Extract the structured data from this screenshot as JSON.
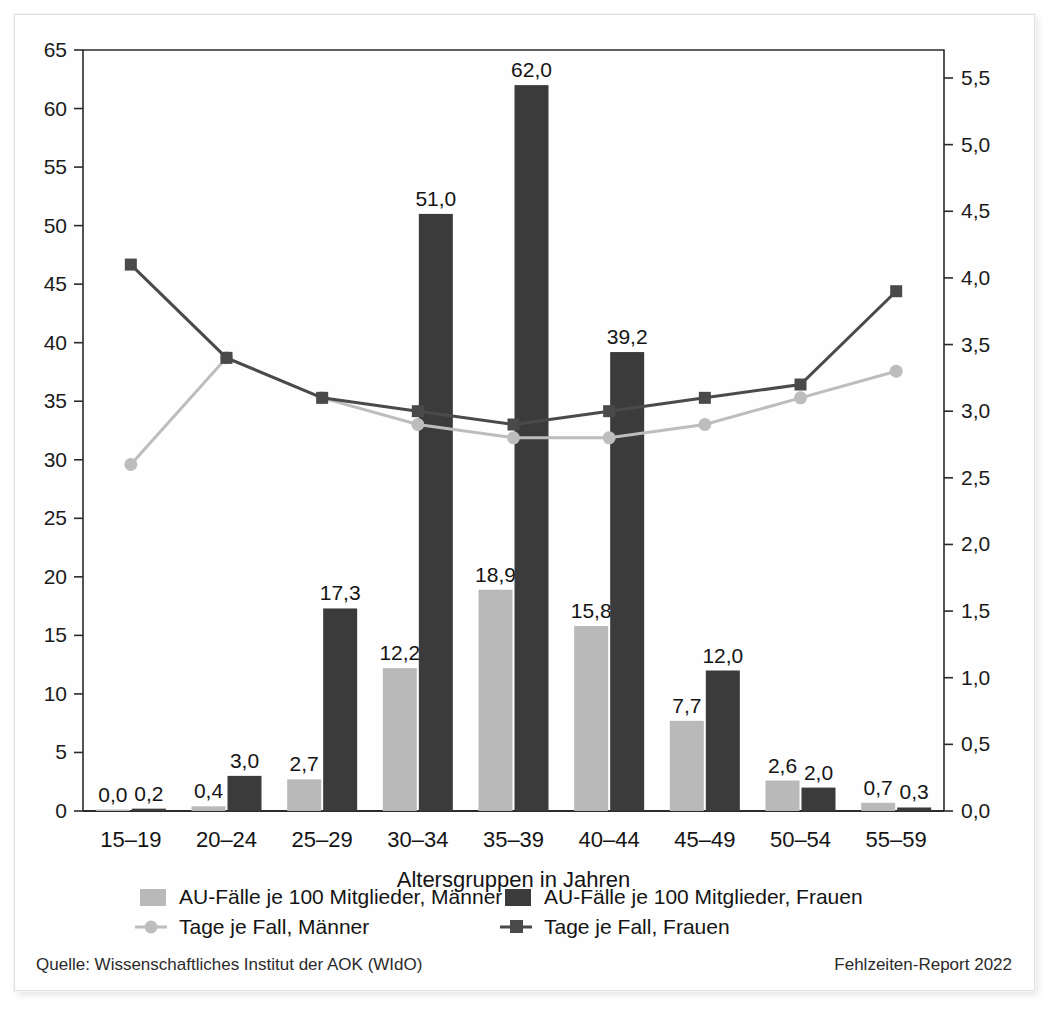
{
  "axis": {
    "left_ticks": [
      "0",
      "5",
      "10",
      "15",
      "20",
      "25",
      "30",
      "35",
      "40",
      "45",
      "50",
      "55",
      "60",
      "65"
    ],
    "right_ticks": [
      "0,0",
      "0,5",
      "1,0",
      "1,5",
      "2,0",
      "2,5",
      "3,0",
      "3,5",
      "4,0",
      "4,5",
      "5,0",
      "5,5"
    ],
    "x_title": "Altersgruppen in Jahren"
  },
  "legend": {
    "items": [
      {
        "label": "AU-Fälle je 100 Mitglieder, Männer",
        "marker": "square-swatch",
        "color": "#b9b9b9"
      },
      {
        "label": "AU-Fälle je 100 Mitglieder, Frauen",
        "marker": "square-swatch",
        "color": "#3b3b3b"
      },
      {
        "label": "Tage je Fall, Männer",
        "marker": "line-circle-marker",
        "color": "#bdbdbd"
      },
      {
        "label": "Tage je Fall, Frauen",
        "marker": "line-square-marker",
        "color": "#4a4a4a"
      }
    ]
  },
  "footer": {
    "source": "Quelle: Wissenschaftliches Institut der AOK (WIdO)",
    "report": "Fehlzeiten-Report 2022"
  },
  "chart_data": {
    "type": "bar",
    "title": "",
    "xlabel": "Altersgruppen in Jahren",
    "ylabel": "",
    "categories": [
      "15–19",
      "20–24",
      "25–29",
      "30–34",
      "35–39",
      "40–44",
      "45–49",
      "50–54",
      "55–59"
    ],
    "ylim": [
      0,
      65
    ],
    "y2lim": [
      0.0,
      5.71
    ],
    "grid": false,
    "legend_position": "bottom",
    "series": [
      {
        "name": "AU-Fälle je 100 Mitglieder, Männer",
        "type": "bar",
        "axis": "left",
        "color": "#b9b9b9",
        "values": [
          0.0,
          0.4,
          2.7,
          12.2,
          18.9,
          15.8,
          7.7,
          2.6,
          0.7
        ],
        "labels": [
          "0,0",
          "0,4",
          "2,7",
          "12,2",
          "18,9",
          "15,8",
          "7,7",
          "2,6",
          "0,7"
        ]
      },
      {
        "name": "AU-Fälle je 100 Mitglieder, Frauen",
        "type": "bar",
        "axis": "left",
        "color": "#3b3b3b",
        "values": [
          0.2,
          3.0,
          17.3,
          51.0,
          62.0,
          39.2,
          12.0,
          2.0,
          0.3
        ],
        "labels": [
          "0,2",
          "3,0",
          "17,3",
          "51,0",
          "62,0",
          "39,2",
          "12,0",
          "2,0",
          "0,3"
        ]
      },
      {
        "name": "Tage je Fall, Männer",
        "type": "line",
        "axis": "right",
        "color": "#bdbdbd",
        "marker": "circle",
        "values": [
          2.6,
          3.4,
          3.1,
          2.9,
          2.8,
          2.8,
          2.9,
          3.1,
          3.3
        ]
      },
      {
        "name": "Tage je Fall, Frauen",
        "type": "line",
        "axis": "right",
        "color": "#4a4a4a",
        "marker": "square",
        "values": [
          4.1,
          3.4,
          3.1,
          3.0,
          2.9,
          3.0,
          3.1,
          3.2,
          3.9
        ]
      }
    ]
  }
}
